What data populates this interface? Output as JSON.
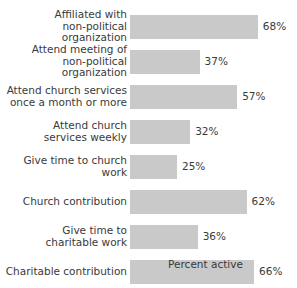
{
  "chart_data": {
    "type": "bar",
    "orientation": "horizontal",
    "title": "",
    "xlabel": "Percent active",
    "ylabel": "",
    "xlim": [
      0,
      100
    ],
    "grid": false,
    "legend": null,
    "bar_color": "#c9c9c9",
    "text_color": "#3a3a3a",
    "background": "#ffffff",
    "value_suffix": "%",
    "categories": [
      "Affiliated with\nnon-political organization",
      "Attend meeting of\nnon-political organization",
      "Attend church services\nonce a month or more",
      "Attend church\nservices weekly",
      "Give time to church work",
      "Church contribution",
      "Give time to\ncharitable work",
      "Charitable contribution"
    ],
    "values": [
      68,
      37,
      57,
      32,
      25,
      62,
      36,
      66
    ],
    "value_labels": [
      "68%",
      "37%",
      "57%",
      "32%",
      "25%",
      "62%",
      "36%",
      "66%"
    ],
    "bars": [
      {
        "category": "Affiliated with\nnon-political organization",
        "value": 68,
        "label": "68%"
      },
      {
        "category": "Attend meeting of\nnon-political organization",
        "value": 37,
        "label": "37%"
      },
      {
        "category": "Attend church services\nonce a month or more",
        "value": 57,
        "label": "57%"
      },
      {
        "category": "Attend church\nservices weekly",
        "value": 32,
        "label": "32%"
      },
      {
        "category": "Give time to church work",
        "value": 25,
        "label": "25%"
      },
      {
        "category": "Church contribution",
        "value": 62,
        "label": "62%"
      },
      {
        "category": "Give time to\ncharitable work",
        "value": 36,
        "label": "36%"
      },
      {
        "category": "Charitable contribution",
        "value": 66,
        "label": "66%"
      }
    ]
  }
}
